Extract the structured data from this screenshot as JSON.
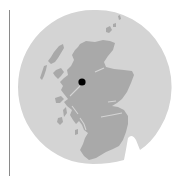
{
  "map": {
    "subject": "Scotland locator map",
    "marker": {
      "label": "location-marker",
      "x": 82,
      "y": 82,
      "r": 3.6
    },
    "colors": {
      "background": "#ffffff",
      "sea_disc": "#d4d4d4",
      "land": "#a9a9a9",
      "marker": "#000000",
      "frame_line": "#8a8a8a"
    }
  }
}
